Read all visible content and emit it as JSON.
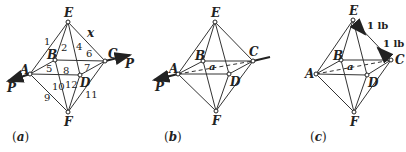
{
  "figure": {
    "panels": [
      {
        "caption": "(a)",
        "caption_letter": "a",
        "nodes": {
          "E": "E",
          "A": "A",
          "B": "B",
          "C": "C",
          "D": "D",
          "F": "F"
        },
        "member_numbers": [
          "1",
          "2",
          "3",
          "4",
          "5",
          "6",
          "7",
          "8",
          "9",
          "10",
          "11",
          "12"
        ],
        "member_x_label": "x",
        "forces": {
          "left": "P",
          "right": "P"
        }
      },
      {
        "caption": "(b)",
        "caption_letter": "b",
        "nodes": {
          "E": "E",
          "A": "A",
          "B": "B",
          "C": "C",
          "D": "D",
          "F": "F"
        },
        "dashed_member_label": "a",
        "forces": {
          "left": "P",
          "right": "P"
        }
      },
      {
        "caption": "(c)",
        "caption_letter": "c",
        "nodes": {
          "E": "E",
          "A": "A",
          "B": "B",
          "C": "C",
          "D": "D",
          "F": "F"
        },
        "dashed_member_label": "a",
        "loads": {
          "at_E": "1 lb",
          "at_C": "1 lb"
        }
      }
    ]
  }
}
